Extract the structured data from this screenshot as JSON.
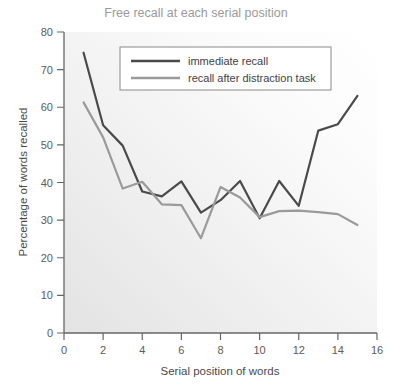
{
  "chart_data": {
    "type": "line",
    "title": "Free recall at each serial position",
    "xlabel": "Serial position of words",
    "ylabel": "Percentage of words recalled",
    "xlim": [
      0,
      16
    ],
    "ylim": [
      0,
      80
    ],
    "xticks": [
      "0",
      "2",
      "4",
      "6",
      "8",
      "10",
      "12",
      "14",
      "16"
    ],
    "yticks": [
      "0",
      "10",
      "20",
      "30",
      "40",
      "50",
      "60",
      "70",
      "80"
    ],
    "xtick_values": [
      0,
      2,
      4,
      6,
      8,
      10,
      12,
      14,
      16
    ],
    "ytick_values": [
      0,
      10,
      20,
      30,
      40,
      50,
      60,
      70,
      80
    ],
    "grid": false,
    "legend_position": "top-center",
    "x": [
      1,
      2,
      3,
      4,
      5,
      6,
      7,
      8,
      9,
      10,
      11,
      12,
      13,
      14,
      15
    ],
    "series": [
      {
        "name": "immediate recall",
        "color": "#4a4a4a",
        "values": [
          74.5,
          55.2,
          49.8,
          37.6,
          36.3,
          40.3,
          32.0,
          35.3,
          40.4,
          30.5,
          40.4,
          33.8,
          53.8,
          55.5,
          63.0
        ]
      },
      {
        "name": "recall after distraction task",
        "color": "#9a9a9a",
        "values": [
          61.3,
          52.0,
          38.4,
          40.2,
          34.2,
          34.0,
          25.2,
          38.8,
          36.0,
          30.8,
          32.4,
          32.5,
          32.1,
          31.6,
          28.7
        ]
      }
    ]
  },
  "legend": {
    "items": [
      {
        "label": "immediate recall",
        "color": "#4a4a4a"
      },
      {
        "label": "recall after distraction task",
        "color": "#9a9a9a"
      }
    ]
  }
}
